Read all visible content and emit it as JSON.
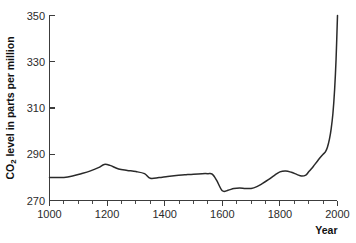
{
  "chart_data": {
    "type": "line",
    "title": "",
    "subtitle": "",
    "xlabel": "Year",
    "ylabel": "CO2 level in parts per million",
    "ylabel_parts": {
      "pre": "CO",
      "sub": "2",
      "post": " level in parts per million"
    },
    "xlim": [
      1000,
      2000
    ],
    "ylim": [
      270,
      350
    ],
    "grid": false,
    "legend": "none",
    "xticks": [
      1000,
      1200,
      1400,
      1600,
      1800,
      2000
    ],
    "xtick_labels": [
      "1000",
      "1200",
      "1400",
      "1600",
      "1800",
      "2000"
    ],
    "xminor_tick_step": 50,
    "yticks": [
      270,
      290,
      310,
      330,
      350
    ],
    "ytick_labels": [
      "270",
      "290",
      "310",
      "330",
      "350"
    ],
    "line_color": "#2a2a2a",
    "axis_color": "#3c3c3c",
    "background_color": "#ffffff",
    "series": [
      {
        "name": "CO2 concentration",
        "x": [
          1000,
          1020,
          1050,
          1080,
          1110,
          1140,
          1170,
          1190,
          1210,
          1240,
          1270,
          1300,
          1330,
          1350,
          1380,
          1410,
          1440,
          1470,
          1500,
          1530,
          1550,
          1565,
          1580,
          1600,
          1620,
          1640,
          1660,
          1680,
          1700,
          1720,
          1740,
          1760,
          1780,
          1800,
          1820,
          1840,
          1860,
          1875,
          1890,
          1900,
          1910,
          1920,
          1930,
          1940,
          1950,
          1958,
          1965,
          1972,
          1978,
          1984,
          1990,
          1995,
          2000
        ],
        "y": [
          280.0,
          280.0,
          280.0,
          280.6,
          281.6,
          282.7,
          284.2,
          285.6,
          285.2,
          283.6,
          283.0,
          282.5,
          281.6,
          279.6,
          279.9,
          280.4,
          280.8,
          281.1,
          281.4,
          281.6,
          281.6,
          281.4,
          278.8,
          274.2,
          274.4,
          275.2,
          275.4,
          275.2,
          275.2,
          276.0,
          277.4,
          279.0,
          280.8,
          282.4,
          282.8,
          282.2,
          281.2,
          280.6,
          281.0,
          282.4,
          283.8,
          285.4,
          287.0,
          288.6,
          290.0,
          291.0,
          293.0,
          296.5,
          301.0,
          307.5,
          318.0,
          331.0,
          350.0
        ]
      }
    ]
  },
  "axes": {
    "y_axis_title": "CO2 level in parts per million",
    "x_axis_title": "Year"
  }
}
